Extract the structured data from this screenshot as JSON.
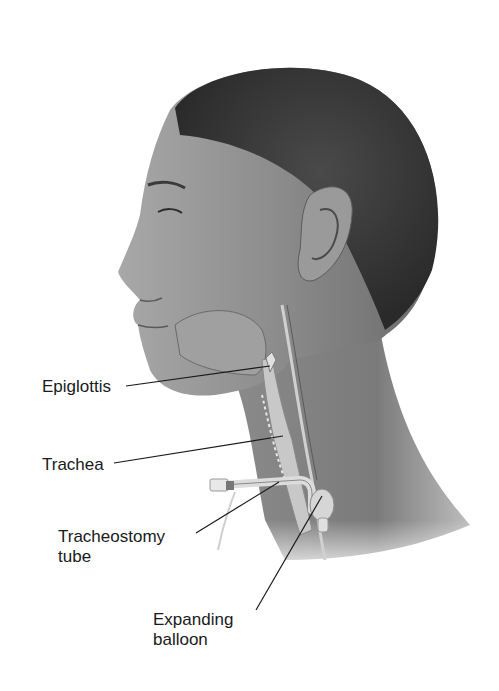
{
  "figure": {
    "labels": [
      {
        "id": "epiglottis",
        "text": "Epiglottis",
        "x": 42,
        "y": 377
      },
      {
        "id": "trachea",
        "text": "Trachea",
        "x": 42,
        "y": 455
      },
      {
        "id": "tracheostomy-tube",
        "line1": "Tracheostomy",
        "line2": "tube",
        "x": 58,
        "y": 527
      },
      {
        "id": "expanding-balloon",
        "line1": "Expanding",
        "line2": "balloon",
        "x": 153,
        "y": 610
      }
    ],
    "colors": {
      "background": "#ffffff",
      "text": "#1a1a1a",
      "leader": "#1a1a1a",
      "hair": "#3a3a3a",
      "skin": "#8a8a8a",
      "skin_light": "#b0b0b0",
      "airway": "#c8c8c8",
      "tube": "#dcdcdc"
    }
  }
}
